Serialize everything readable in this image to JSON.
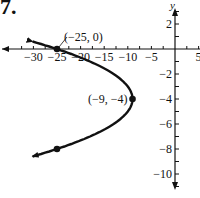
{
  "problem_number": "7.",
  "chart_data": {
    "type": "line",
    "title": "",
    "equation_implied": "x = -(y + 4)^2 - 9",
    "xlabel": "",
    "ylabel": "y",
    "xlim": [
      -33,
      6
    ],
    "ylim": [
      -11,
      3
    ],
    "x_ticks": [
      -30,
      -25,
      -20,
      -15,
      -10,
      -5,
      5
    ],
    "x_tick_labels": [
      "-30",
      "-25",
      "-20",
      "-15",
      "-10",
      "-5",
      "5"
    ],
    "y_ticks": [
      2,
      -2,
      -4,
      -6,
      -8,
      -10
    ],
    "y_tick_labels": [
      "2",
      "−2",
      "−4",
      "−6",
      "−8",
      "−10"
    ],
    "grid": false,
    "series": [
      {
        "name": "parabola",
        "color": "#111111",
        "points": [
          {
            "x": -30.4,
            "y": 0.6
          },
          {
            "x": -25,
            "y": 0
          },
          {
            "x": -18,
            "y": -1
          },
          {
            "x": -13,
            "y": -2
          },
          {
            "x": -10,
            "y": -3
          },
          {
            "x": -9,
            "y": -4
          },
          {
            "x": -10,
            "y": -5
          },
          {
            "x": -13,
            "y": -6
          },
          {
            "x": -18,
            "y": -7
          },
          {
            "x": -25,
            "y": -8
          },
          {
            "x": -30.4,
            "y": -8.6
          }
        ]
      }
    ],
    "marked_points": [
      {
        "x": -25,
        "y": 0,
        "label": "(−25, 0)"
      },
      {
        "x": -9,
        "y": -4,
        "label": "(−9, −4)"
      },
      {
        "x": -25,
        "y": -8,
        "label": ""
      }
    ]
  }
}
